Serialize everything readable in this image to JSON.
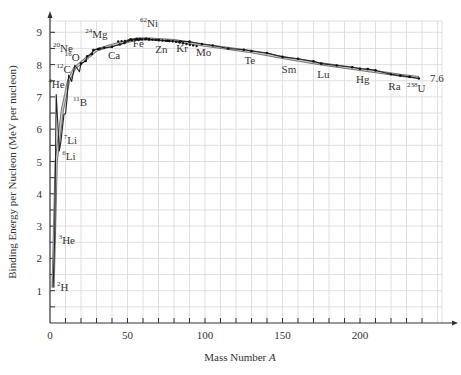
{
  "chart_data": {
    "type": "line",
    "title": "",
    "xlabel": "Mass Number A",
    "ylabel": "Binding Energy per Nucleon (MeV per nucleon)",
    "xlim": [
      0,
      250
    ],
    "ylim": [
      0,
      9.5
    ],
    "xticks": [
      0,
      50,
      100,
      150,
      200
    ],
    "xtick_minor_step": 10,
    "yticks": [
      1,
      2,
      3,
      4,
      5,
      6,
      7,
      8,
      9
    ],
    "ytick_minor_step": 0.5,
    "grid": true,
    "legend": null,
    "series": [
      {
        "name": "Measured nuclides (dots)",
        "x": [
          2,
          3,
          4,
          6,
          7,
          9,
          10,
          11,
          12,
          14,
          16,
          19,
          20,
          23,
          24,
          27,
          28,
          31,
          32,
          35,
          40,
          45,
          48,
          52,
          56,
          58,
          62,
          64,
          70,
          76,
          84,
          90,
          98,
          105,
          115,
          125,
          130,
          140,
          150,
          160,
          170,
          175,
          185,
          195,
          200,
          205,
          210,
          220,
          226,
          232,
          238
        ],
        "y": [
          1.1,
          2.57,
          7.07,
          5.33,
          5.6,
          6.46,
          6.48,
          6.93,
          7.68,
          7.48,
          7.98,
          7.78,
          8.03,
          8.11,
          8.26,
          8.33,
          8.45,
          8.48,
          8.49,
          8.52,
          8.55,
          8.62,
          8.67,
          8.78,
          8.79,
          8.79,
          8.8,
          8.78,
          8.76,
          8.74,
          8.72,
          8.71,
          8.64,
          8.59,
          8.5,
          8.46,
          8.42,
          8.36,
          8.24,
          8.18,
          8.1,
          8.03,
          7.97,
          7.92,
          7.87,
          7.86,
          7.82,
          7.7,
          7.66,
          7.62,
          7.57
        ]
      },
      {
        "name": "Smooth trend",
        "x": [
          2,
          4,
          8,
          12,
          16,
          20,
          30,
          40,
          56,
          62,
          80,
          100,
          130,
          150,
          175,
          200,
          226,
          238
        ],
        "y": [
          1.1,
          5.0,
          6.6,
          7.5,
          7.9,
          8.05,
          8.45,
          8.6,
          8.79,
          8.8,
          8.74,
          8.6,
          8.4,
          8.22,
          8.02,
          7.85,
          7.67,
          7.6
        ]
      }
    ],
    "annotations": [
      {
        "mass": "2",
        "element": "H",
        "x": 2,
        "y": 1.1
      },
      {
        "mass": "3",
        "element": "He",
        "x": 3,
        "y": 2.57
      },
      {
        "mass": "4",
        "element": "He",
        "x": 4,
        "y": 7.07
      },
      {
        "mass": "6",
        "element": "Li",
        "x": 6,
        "y": 5.33
      },
      {
        "mass": "7",
        "element": "Li",
        "x": 7,
        "y": 5.6
      },
      {
        "mass": "11",
        "element": "B",
        "x": 11,
        "y": 6.93
      },
      {
        "mass": "12",
        "element": "C",
        "x": 12,
        "y": 7.68
      },
      {
        "mass": "16",
        "element": "O",
        "x": 16,
        "y": 7.98
      },
      {
        "mass": "20",
        "element": "Ne",
        "x": 20,
        "y": 8.03
      },
      {
        "mass": "24",
        "element": "Mg",
        "x": 24,
        "y": 8.26
      },
      {
        "mass": "",
        "element": "Ca",
        "x": 40,
        "y": 8.55
      },
      {
        "mass": "",
        "element": "Fe",
        "x": 56,
        "y": 8.79
      },
      {
        "mass": "62",
        "element": "Ni",
        "x": 62,
        "y": 8.8
      },
      {
        "mass": "",
        "element": "Zn",
        "x": 64,
        "y": 8.74
      },
      {
        "mass": "",
        "element": "Kr",
        "x": 84,
        "y": 8.72
      },
      {
        "mass": "",
        "element": "Mo",
        "x": 98,
        "y": 8.64
      },
      {
        "mass": "",
        "element": "Te",
        "x": 128,
        "y": 8.44
      },
      {
        "mass": "",
        "element": "Sm",
        "x": 152,
        "y": 8.24
      },
      {
        "mass": "",
        "element": "Lu",
        "x": 175,
        "y": 8.03
      },
      {
        "mass": "",
        "element": "Hg",
        "x": 200,
        "y": 7.87
      },
      {
        "mass": "",
        "element": "Ra",
        "x": 226,
        "y": 7.66
      },
      {
        "mass": "238",
        "element": "U",
        "x": 238,
        "y": 7.57
      },
      {
        "text": "7.6",
        "x": 240,
        "y": 7.6
      }
    ]
  }
}
